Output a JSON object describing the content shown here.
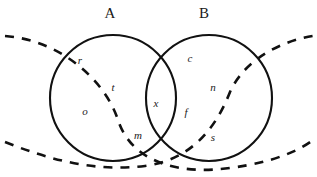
{
  "diagram": {
    "type": "venn-diagram",
    "width": 317,
    "height": 177,
    "background_color": "#ffffff",
    "stroke_color": "#111111",
    "text_color": "#1a1a1a",
    "sets": [
      {
        "id": "A",
        "label": "A",
        "label_x": 110,
        "label_y": 18,
        "center_x": 113,
        "center_y": 98,
        "radius": 63,
        "style": "solid"
      },
      {
        "id": "B",
        "label": "B",
        "label_x": 204,
        "label_y": 18,
        "center_x": 209,
        "center_y": 98,
        "radius": 63,
        "style": "solid"
      }
    ],
    "dashed_curves": [
      {
        "id": "dashed-curve-1",
        "description": "dashed arc from upper-left to lower-right",
        "path": "M 5,36 C 60,40 105,80 118,120 C 132,163 180,175 230,168 C 275,162 300,150 313,140",
        "style": "dashed"
      },
      {
        "id": "dashed-curve-2",
        "description": "dashed arc from lower-left to upper-right",
        "path": "M 5,142 C 50,160 95,172 145,166 C 190,160 215,130 230,92 C 245,58 285,40 313,36",
        "style": "dashed"
      }
    ],
    "elements": [
      {
        "text": "r",
        "x": 80,
        "y": 61,
        "region": "A-only"
      },
      {
        "text": "t",
        "x": 113,
        "y": 88,
        "region": "A-only"
      },
      {
        "text": "o",
        "x": 85,
        "y": 112,
        "region": "A-only"
      },
      {
        "text": "m",
        "x": 138,
        "y": 136,
        "region": "A-only"
      },
      {
        "text": "x",
        "x": 156,
        "y": 104,
        "region": "A-and-B"
      },
      {
        "text": "c",
        "x": 190,
        "y": 59,
        "region": "B-only"
      },
      {
        "text": "n",
        "x": 213,
        "y": 88,
        "region": "B-only"
      },
      {
        "text": "f",
        "x": 186,
        "y": 113,
        "region": "B-only"
      },
      {
        "text": "s",
        "x": 213,
        "y": 138,
        "region": "B-only"
      }
    ]
  }
}
